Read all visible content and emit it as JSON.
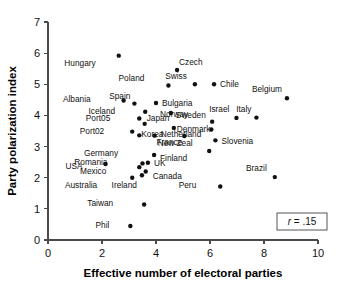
{
  "chart_data": {
    "type": "scatter",
    "title": "",
    "xlabel": "Effective number of electoral parties",
    "ylabel": "Party polarization index",
    "xlim": [
      0,
      10
    ],
    "ylim": [
      0,
      7
    ],
    "xticks": [
      0,
      2,
      4,
      6,
      8,
      10
    ],
    "yticks": [
      0,
      1,
      2,
      3,
      4,
      5,
      6,
      7
    ],
    "grid": false,
    "legend": null,
    "annotations": [
      {
        "name": "correlation-box",
        "text": "r = .15",
        "stat_symbol": "r",
        "stat_value": ".15",
        "position": "bottom-right"
      }
    ],
    "point_labels_shown": true,
    "points": [
      {
        "label": "Hungary",
        "x": 2.62,
        "y": 5.92,
        "label_dx": -23,
        "label_dy": 10
      },
      {
        "label": "Czech",
        "x": 4.78,
        "y": 5.46,
        "label_dx": 2,
        "label_dy": -5
      },
      {
        "label": "Poland",
        "x": 4.46,
        "y": 4.96,
        "label_dx": -24,
        "label_dy": -5
      },
      {
        "label": "Swiss",
        "x": 5.44,
        "y": 5.0,
        "label_dx": -8,
        "label_dy": -5
      },
      {
        "label": "Chile",
        "x": 6.15,
        "y": 5.0,
        "label_dx": 6,
        "label_dy": 3
      },
      {
        "label": "Belgium",
        "x": 8.85,
        "y": 4.55,
        "label_dx": -5,
        "label_dy": -6
      },
      {
        "label": "Albania",
        "x": 2.8,
        "y": 4.48,
        "label_dx": -33,
        "label_dy": 2
      },
      {
        "label": "Spain",
        "x": 3.2,
        "y": 4.38,
        "label_dx": -4,
        "label_dy": -5
      },
      {
        "label": "Bulgaria",
        "x": 4.0,
        "y": 4.4,
        "label_dx": 6,
        "label_dy": 3
      },
      {
        "label": "Iceland",
        "x": 3.6,
        "y": 4.12,
        "label_dx": -30,
        "label_dy": 2
      },
      {
        "label": "Sweden",
        "x": 4.55,
        "y": 4.08,
        "label_dx": 5,
        "label_dy": 5
      },
      {
        "label": "Norway",
        "x": 6.08,
        "y": 3.8,
        "label_dx": -24,
        "label_dy": -5
      },
      {
        "label": "Israel",
        "x": 6.98,
        "y": 3.92,
        "label_dx": -7,
        "label_dy": -6
      },
      {
        "label": "Italy",
        "x": 7.72,
        "y": 3.93,
        "label_dx": -5,
        "label_dy": -6
      },
      {
        "label": "Port05",
        "x": 3.38,
        "y": 3.9,
        "label_dx": -29,
        "label_dy": 2
      },
      {
        "label": "Japan",
        "x": 3.58,
        "y": 3.73,
        "label_dx": 2,
        "label_dy": -3
      },
      {
        "label": "Denmark",
        "x": 4.66,
        "y": 3.6,
        "label_dx": 3,
        "label_dy": 4
      },
      {
        "label": "Netherland",
        "x": 6.05,
        "y": 3.55,
        "label_dx": -10,
        "label_dy": 8
      },
      {
        "label": "Port02",
        "x": 3.12,
        "y": 3.48,
        "label_dx": -28,
        "label_dy": 2
      },
      {
        "label": "Korea",
        "x": 3.38,
        "y": 3.36,
        "label_dx": 2,
        "label_dy": 2
      },
      {
        "label": "France",
        "x": 5.05,
        "y": 3.34,
        "label_dx": -2,
        "label_dy": 9
      },
      {
        "label": "New Zeal",
        "x": 3.95,
        "y": 3.35,
        "label_dx": 3,
        "label_dy": 10
      },
      {
        "label": "Slovenia",
        "x": 6.2,
        "y": 3.2,
        "label_dx": 6,
        "label_dy": 4
      },
      {
        "label": "Finland",
        "x": 5.97,
        "y": 2.86,
        "label_dx": -22,
        "label_dy": 10
      },
      {
        "label": "Germany",
        "x": 3.93,
        "y": 2.73,
        "label_dx": -36,
        "label_dy": 1
      },
      {
        "label": "USA",
        "x": 2.13,
        "y": 2.44,
        "label_dx": -23,
        "label_dy": 5
      },
      {
        "label": "Romania",
        "x": 3.5,
        "y": 2.46,
        "label_dx": -35,
        "label_dy": 2
      },
      {
        "label": "UK",
        "x": 3.7,
        "y": 2.48,
        "label_dx": 6,
        "label_dy": 3
      },
      {
        "label": "Mexico",
        "x": 3.38,
        "y": 2.34,
        "label_dx": -33,
        "label_dy": 7
      },
      {
        "label": "Canada",
        "x": 3.62,
        "y": 2.2,
        "label_dx": 7,
        "label_dy": 8
      },
      {
        "label": "Australia",
        "x": 3.12,
        "y": 2.0,
        "label_dx": -35,
        "label_dy": 10
      },
      {
        "label": "Ireland",
        "x": 3.48,
        "y": 2.08,
        "label_dx": -5,
        "label_dy": 13
      },
      {
        "label": "Brazil",
        "x": 8.4,
        "y": 2.02,
        "label_dx": -8,
        "label_dy": -6
      },
      {
        "label": "Peru",
        "x": 6.38,
        "y": 1.72,
        "label_dx": -24,
        "label_dy": 2
      },
      {
        "label": "Taiwan",
        "x": 3.56,
        "y": 1.14,
        "label_dx": -31,
        "label_dy": 2
      },
      {
        "label": "Phil",
        "x": 3.05,
        "y": 0.45,
        "label_dx": -21,
        "label_dy": 2
      }
    ]
  },
  "axes": {
    "x_title": "Effective number of electoral parties",
    "y_title": "Party polarization index"
  },
  "colors": {
    "point": "#111111",
    "axis": "#4a4a4a",
    "text": "#111111",
    "background": "#ffffff"
  }
}
